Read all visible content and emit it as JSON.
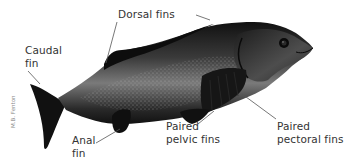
{
  "figure": {
    "credit": "M.B. Fenton",
    "colors": {
      "background": "#ffffff",
      "label_text": "#333333",
      "leader_line": "#555555",
      "fish_dark": "#151515",
      "fish_mid": "#5a5a5a",
      "fish_light": "#a8a8a8"
    }
  },
  "labels": {
    "dorsal": {
      "text": "Dorsal fins"
    },
    "caudal": {
      "line1": "Caudal",
      "line2": "fin"
    },
    "anal": {
      "line1": "Anal",
      "line2": "fin"
    },
    "pelvic": {
      "line1": "Paired",
      "line2": "pelvic fins"
    },
    "pectoral": {
      "line1": "Paired",
      "line2": "pectoral fins"
    }
  }
}
